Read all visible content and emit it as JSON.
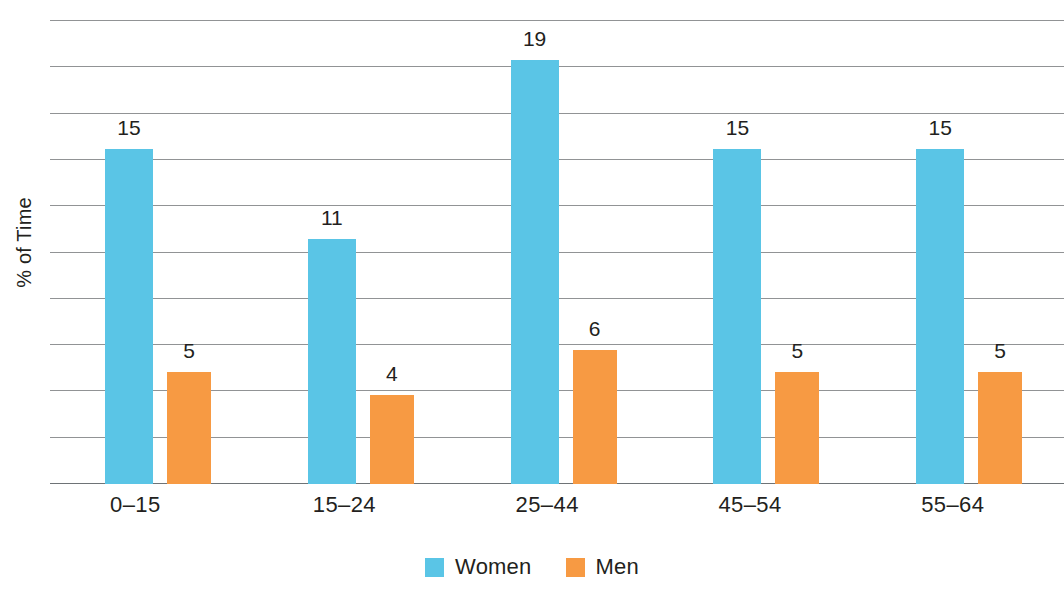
{
  "chart_data": {
    "type": "bar",
    "title": "",
    "xlabel": "",
    "ylabel": "% of Time",
    "categories": [
      "0–15",
      "15–24",
      "25–44",
      "45–54",
      "55–64"
    ],
    "series": [
      {
        "name": "Women",
        "color": "#5ac5e6",
        "values": [
          15,
          11,
          19,
          15,
          15
        ]
      },
      {
        "name": "Men",
        "color": "#f79a43",
        "values": [
          5,
          4,
          6,
          5,
          5
        ]
      }
    ],
    "value_labels": {
      "women": [
        "15",
        "11",
        "19",
        "15",
        "15"
      ],
      "men": [
        "5",
        "4",
        "6",
        "5",
        "5"
      ]
    },
    "ylim": [
      0,
      20.8
    ],
    "grid": true,
    "gridline_count": 10,
    "gridline_step": 2,
    "y_tick_labels": [],
    "legend_position": "bottom-center",
    "legend": [
      {
        "label": "Women",
        "color": "#5ac5e6"
      },
      {
        "label": "Men",
        "color": "#f79a43"
      }
    ]
  },
  "axis": {
    "y_title": "% of Time"
  },
  "colors": {
    "women": "#5ac5e6",
    "men": "#f79a43",
    "gridline": "#7e8083",
    "text": "#231f20",
    "background": "#ffffff"
  }
}
